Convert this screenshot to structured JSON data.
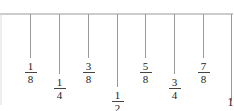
{
  "diagram": {
    "type": "ruler-scale",
    "unit_label": "1",
    "marks": [
      {
        "value": 0.125,
        "label": {
          "num": "1",
          "den": "8"
        },
        "tier": "short"
      },
      {
        "value": 0.25,
        "label": {
          "num": "1",
          "den": "4"
        },
        "tier": "medium"
      },
      {
        "value": 0.375,
        "label": {
          "num": "3",
          "den": "8"
        },
        "tier": "short"
      },
      {
        "value": 0.5,
        "label": {
          "num": "1",
          "den": "2"
        },
        "tier": "long"
      },
      {
        "value": 0.625,
        "label": {
          "num": "5",
          "den": "8"
        },
        "tier": "short"
      },
      {
        "value": 0.75,
        "label": {
          "num": "3",
          "den": "4"
        },
        "tier": "medium"
      },
      {
        "value": 0.875,
        "label": {
          "num": "7",
          "den": "8"
        },
        "tier": "short"
      },
      {
        "value": 1.0,
        "label": {
          "whole": "1"
        },
        "tier": "end"
      }
    ],
    "line_color": "#999999"
  }
}
